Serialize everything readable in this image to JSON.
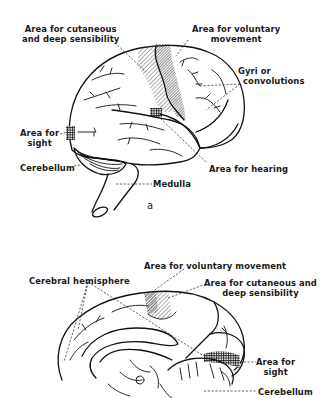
{
  "figure_a": {
    "letter": "a",
    "view": "lateral view of brain",
    "labels": {
      "cutaneous_line1": "Area for cutaneous",
      "cutaneous_line2": "and deep sensibility",
      "voluntary_line1": "Area for voluntary",
      "voluntary_line2": "movement",
      "gyri_line1": "Gyri or",
      "gyri_line2": "convolutions",
      "sight_line1": "Area for",
      "sight_line2": "sight",
      "cerebellum": "Cerebellum",
      "hearing": "Area for hearing",
      "medulla": "Medulla"
    }
  },
  "figure_b": {
    "view": "medial (sagittal) view of brain",
    "labels": {
      "voluntary": "Area for voluntary movement",
      "cutaneous_line1": "Area for cutaneous and",
      "cutaneous_line2": "deep sensibility",
      "cerebral_hemisphere": "Cerebral hemisphere",
      "sight_line1": "Area for",
      "sight_line2": "sight",
      "cerebellum": "Cerebellum"
    }
  },
  "colors": {
    "ink": "#111111",
    "background": "#ffffff"
  }
}
